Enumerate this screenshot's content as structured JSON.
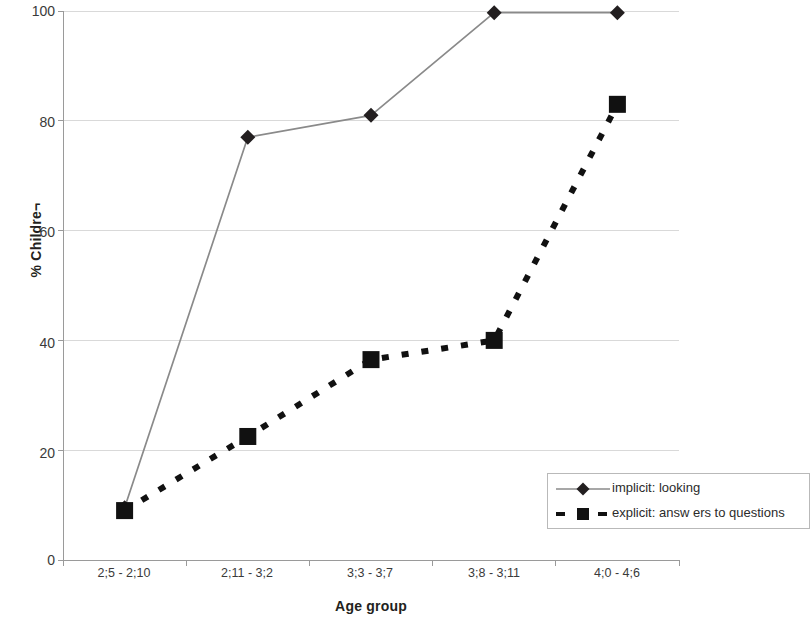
{
  "chart_data": {
    "type": "line",
    "title": "",
    "xlabel": "Age group",
    "ylabel": "% Children",
    "categories": [
      "2;5 - 2;10",
      "2;11 - 3;2",
      "3;3 - 3;7",
      "3;8 - 3;11",
      "4;0 - 4;6"
    ],
    "ylim": [
      0,
      100
    ],
    "yticks": [
      0,
      20,
      40,
      60,
      80,
      100
    ],
    "ytick_labels": [
      "0",
      "20",
      "40",
      "60",
      "80",
      "100"
    ],
    "grid": "horizontal",
    "legend_position": "lower right",
    "series": [
      {
        "name": "implicit: looking",
        "values": [
          9.5,
          77,
          81,
          99.7,
          99.7
        ],
        "color": "#8a8a8a",
        "line_style": "solid",
        "marker": "diamond",
        "marker_color": "#231f20"
      },
      {
        "name": "explicit: answ ers to questions",
        "values": [
          9,
          22.5,
          36.5,
          40,
          83
        ],
        "color": "#111111",
        "line_style": "dashed",
        "marker": "square",
        "marker_color": "#111111"
      }
    ]
  },
  "axes": {
    "y_title": "% Childre¬",
    "x_title": "Age group",
    "y_tick_0": "0",
    "y_tick_20": "20",
    "y_tick_40": "40",
    "y_tick_60": "60",
    "y_tick_80": "80",
    "y_tick_100": "100",
    "x_tick_1": "2;5 - 2;10",
    "x_tick_2": "2;11 - 3;2",
    "x_tick_3": "3;3 - 3;7",
    "x_tick_4": "3;8 - 3;11",
    "x_tick_5": "4;0 - 4;6"
  },
  "legend": {
    "entry_1": "implicit: looking",
    "entry_2": "explicit: answ ers to questions"
  },
  "colors": {
    "implicit_line": "#8a8a8a",
    "explicit_line": "#111111",
    "gridline": "#d9d9d9",
    "axis": "#9a9a9a",
    "text": "#2b2b2b"
  }
}
